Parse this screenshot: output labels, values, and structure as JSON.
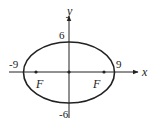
{
  "diagram": {
    "type": "ellipse",
    "axes": {
      "x_label": "x",
      "y_label": "y"
    },
    "ticks": {
      "x_neg": "-9",
      "x_pos": "9",
      "y_pos": "6",
      "y_neg": "-6"
    },
    "foci": [
      {
        "label": "F"
      },
      {
        "label": "F"
      }
    ],
    "colors": {
      "stroke": "#222222",
      "background": "#ffffff"
    }
  }
}
